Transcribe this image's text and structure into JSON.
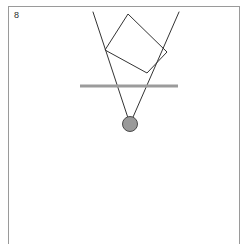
{
  "panel": {
    "label": "8",
    "border_color": "#9a9a9a",
    "background": "#ffffff",
    "width": 249,
    "height": 244,
    "frame": {
      "x": 8,
      "y": 6,
      "width": 232,
      "height": 238
    }
  },
  "figure": {
    "title": "",
    "stroke_color": "#333333",
    "stroke_width": 1,
    "surface_color": "#9b9b9b",
    "circle_fill": "#9a9a9a",
    "circle_stroke": "#4a4a4a",
    "elements": {
      "rectangle": {
        "name": "tilted-rectangle",
        "points": "105,50 128,14 167,52 147,73",
        "fill": "none",
        "stroke": "#333333",
        "stroke_width": 1
      },
      "ray_left": {
        "name": "left-ray",
        "x1": 93,
        "y1": 12,
        "x2": 130,
        "y2": 124,
        "stroke": "#333333",
        "stroke_width": 1
      },
      "ray_right": {
        "name": "right-ray",
        "x1": 179,
        "y1": 12,
        "x2": 130,
        "y2": 124,
        "stroke": "#333333",
        "stroke_width": 1
      },
      "surface_line": {
        "name": "horizontal-surface-line",
        "x1": 80,
        "y1": 86,
        "x2": 178,
        "y2": 86,
        "stroke": "#9b9b9b",
        "stroke_width": 3
      },
      "bob": {
        "name": "pendulum-bob-circle",
        "cx": 130,
        "cy": 124,
        "r": 7.5,
        "fill": "#9a9a9a",
        "stroke": "#4a4a4a",
        "stroke_width": 1
      }
    }
  }
}
